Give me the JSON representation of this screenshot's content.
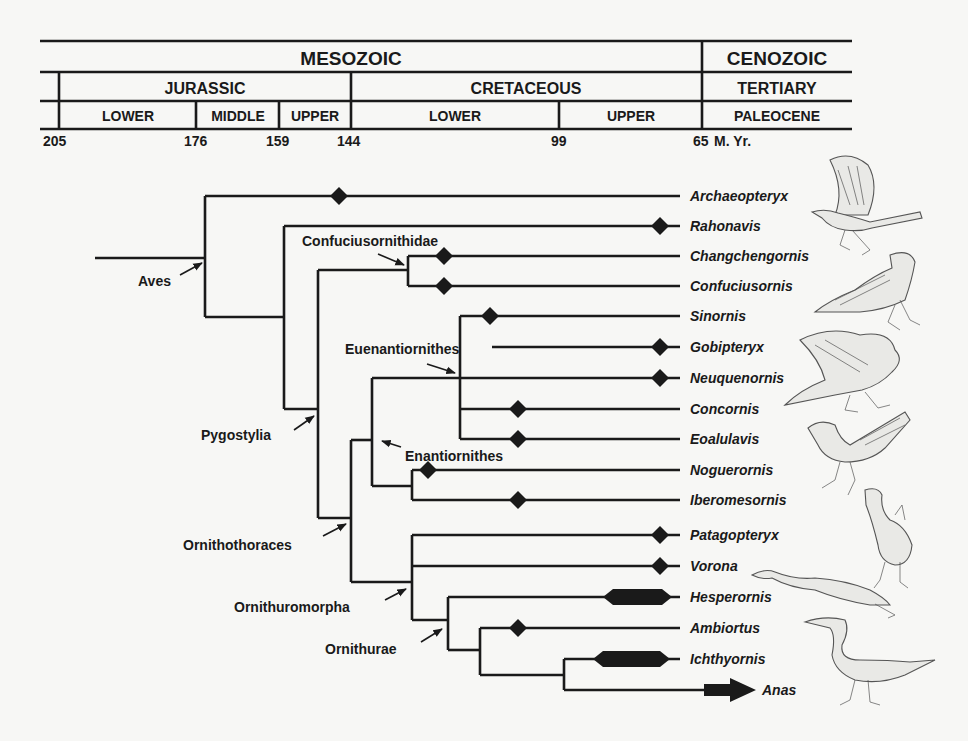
{
  "timescale": {
    "eras": [
      {
        "label": "MESOZOIC",
        "from": 205,
        "to": 65
      },
      {
        "label": "CENOZOIC",
        "from": 65,
        "to": 0
      }
    ],
    "periods": [
      {
        "label": "JURASSIC",
        "from": 205,
        "to": 144
      },
      {
        "label": "CRETACEOUS",
        "from": 144,
        "to": 65
      },
      {
        "label": "TERTIARY",
        "from": 65,
        "to": 0
      }
    ],
    "epochs": [
      {
        "label": "LOWER",
        "from": 205,
        "to": 176
      },
      {
        "label": "MIDDLE",
        "from": 176,
        "to": 159
      },
      {
        "label": "UPPER",
        "from": 159,
        "to": 144
      },
      {
        "label": "LOWER",
        "from": 144,
        "to": 99
      },
      {
        "label": "UPPER",
        "from": 99,
        "to": 65
      },
      {
        "label": "PALEOCENE",
        "from": 65,
        "to": 0
      }
    ],
    "ticks": [
      "205",
      "176",
      "159",
      "144",
      "99",
      "65"
    ],
    "unit_label": "M. Yr."
  },
  "taxa": [
    {
      "name": "Archaeopteryx",
      "marker": "diamond",
      "marker_ma": 150
    },
    {
      "name": "Rahonavis",
      "marker": "diamond",
      "marker_ma": 70
    },
    {
      "name": "Changchengornis",
      "marker": "diamond",
      "marker_ma": 121
    },
    {
      "name": "Confuciusornis",
      "marker": "diamond",
      "marker_ma": 121
    },
    {
      "name": "Sinornis",
      "marker": "diamond",
      "marker_ma": 131
    },
    {
      "name": "Gobipteryx",
      "marker": "diamond",
      "marker_ma": 70
    },
    {
      "name": "Neuquenornis",
      "marker": "diamond",
      "marker_ma": 70
    },
    {
      "name": "Concornis",
      "marker": "diamond",
      "marker_ma": 115
    },
    {
      "name": "Eoalulavis",
      "marker": "diamond",
      "marker_ma": 115
    },
    {
      "name": "Noguerornis",
      "marker": "diamond",
      "marker_ma": 140
    },
    {
      "name": "Iberomesornis",
      "marker": "diamond",
      "marker_ma": 115
    },
    {
      "name": "Patagopteryx",
      "marker": "diamond",
      "marker_ma": 70
    },
    {
      "name": "Vorona",
      "marker": "diamond",
      "marker_ma": 70
    },
    {
      "name": "Hesperornis",
      "marker": "bar",
      "bar_ma": [
        85,
        70
      ]
    },
    {
      "name": "Ambiortus",
      "marker": "diamond",
      "marker_ma": 115
    },
    {
      "name": "Ichthyornis",
      "marker": "bar",
      "bar_ma": [
        90,
        70
      ]
    },
    {
      "name": "Anas",
      "marker": "arrow",
      "bar_ma": [
        68,
        62
      ]
    }
  ],
  "clades": [
    {
      "label": "Aves"
    },
    {
      "label": "Confuciusornithidae"
    },
    {
      "label": "Pygostylia"
    },
    {
      "label": "Euenantiornithes"
    },
    {
      "label": "Enantiornithes"
    },
    {
      "label": "Ornithothoraces"
    },
    {
      "label": "Ornithuromorpha"
    },
    {
      "label": "Ornithurae"
    }
  ],
  "illustrations": [
    {
      "name": "archaeopteryx-illustration"
    },
    {
      "name": "confuciusornis-illustration"
    },
    {
      "name": "enantiornithine-illustration"
    },
    {
      "name": "eoalulavis-illustration"
    },
    {
      "name": "patagopteryx-illustration"
    },
    {
      "name": "hesperornis-illustration"
    },
    {
      "name": "ichthyornis-illustration"
    }
  ]
}
